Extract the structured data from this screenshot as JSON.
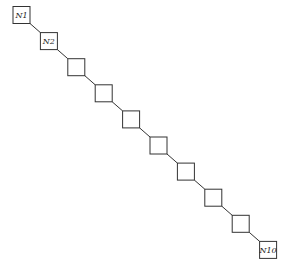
{
  "diagram": {
    "type": "chain",
    "nodes": [
      {
        "id": 1,
        "label": "N1"
      },
      {
        "id": 2,
        "label": "N2"
      },
      {
        "id": 3,
        "label": ""
      },
      {
        "id": 4,
        "label": ""
      },
      {
        "id": 5,
        "label": ""
      },
      {
        "id": 6,
        "label": ""
      },
      {
        "id": 7,
        "label": ""
      },
      {
        "id": 8,
        "label": ""
      },
      {
        "id": 9,
        "label": ""
      },
      {
        "id": 10,
        "label": "N10"
      }
    ],
    "edges": [
      [
        1,
        2
      ],
      [
        2,
        3
      ],
      [
        3,
        4
      ],
      [
        4,
        5
      ],
      [
        5,
        6
      ],
      [
        6,
        7
      ],
      [
        7,
        8
      ],
      [
        8,
        9
      ],
      [
        9,
        10
      ]
    ],
    "colors": {
      "stroke": "#333333",
      "fill": "#ffffff"
    }
  }
}
